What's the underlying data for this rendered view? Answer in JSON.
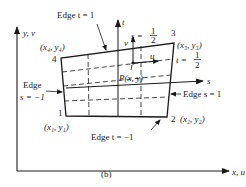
{
  "figure": {
    "caption": "(b)",
    "axes": {
      "y_label": "y, v",
      "x_label": "x, u",
      "t_label": "t",
      "s_label": "s"
    },
    "nodes": [
      {
        "id": "1",
        "number": "1",
        "coord_label": "(x₁, y₁)"
      },
      {
        "id": "2",
        "number": "2",
        "coord_label": "(x₂, y₂)"
      },
      {
        "id": "3",
        "number": "3",
        "coord_label": "(x₃, y₃)"
      },
      {
        "id": "4",
        "number": "4",
        "coord_label": "(x₄, y₄)"
      }
    ],
    "edges": {
      "top": "Edge t = 1",
      "bottom": "Edge t = −1",
      "left_line1": "Edge",
      "left_line2": "s = −1",
      "right": "Edge s = 1"
    },
    "annotations": {
      "s_half_prefix": "s =",
      "t_half_prefix": "t =",
      "half_num": "1",
      "half_den": "2",
      "point": "P(x, y)",
      "u_label": "u",
      "v_label": "v"
    },
    "colors": {
      "ink": "#1a1a1a",
      "background": "#ffffff"
    }
  }
}
